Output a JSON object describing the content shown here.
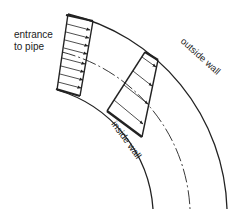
{
  "diagram": {
    "labels": {
      "entrance_line1": "entrance",
      "entrance_line2": "to pipe",
      "outside_wall": "outside wall",
      "inside_wall": "inside wall"
    },
    "colors": {
      "stroke": "#222222",
      "background": "#ffffff"
    },
    "elements": [
      "outside-wall-arc",
      "inside-wall-arc",
      "centerline-dash-dot-arc",
      "entrance-uniform-velocity-profile",
      "bend-skewed-velocity-profile"
    ]
  }
}
